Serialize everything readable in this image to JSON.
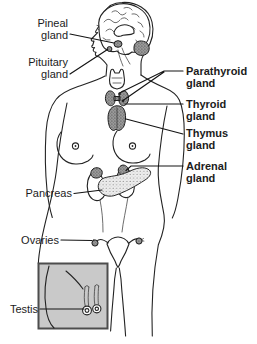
{
  "diagram_title": "Endocrine system anatomical diagram",
  "labels": {
    "pineal": {
      "line1": "Pineal",
      "line2": "gland"
    },
    "pituitary": {
      "line1": "Pituitary",
      "line2": "gland"
    },
    "parathyroid": {
      "line1": "Parathyroid",
      "line2": "gland"
    },
    "thyroid": {
      "line1": "Thyroid",
      "line2": "gland"
    },
    "thymus": {
      "line1": "Thymus",
      "line2": "gland"
    },
    "adrenal": {
      "line1": "Adrenal",
      "line2": "gland"
    },
    "pancreas": {
      "line1": "Pancreas"
    },
    "ovaries": {
      "line1": "Ovaries"
    },
    "testis": {
      "line1": "Testis"
    }
  },
  "colors": {
    "ink": "#232323",
    "label_text": "#1c1c1c",
    "inset_fill": "#c9c9c9",
    "inset_border": "#4d4d4d",
    "stipple_dark_base": "#999999",
    "stipple_light_base": "#ededed",
    "background": "#ffffff"
  }
}
